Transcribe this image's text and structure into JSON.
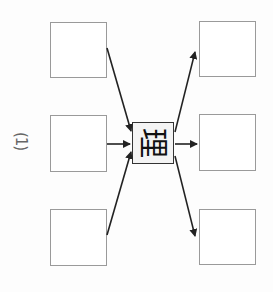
{
  "diagram": {
    "label": "(1)",
    "center_character": "理",
    "left_boxes": [
      "",
      "",
      ""
    ],
    "right_boxes": [
      "",
      "",
      ""
    ],
    "colors": {
      "box_border": "#9a9a9a",
      "arrow": "#222222",
      "center_border": "#333333"
    }
  }
}
